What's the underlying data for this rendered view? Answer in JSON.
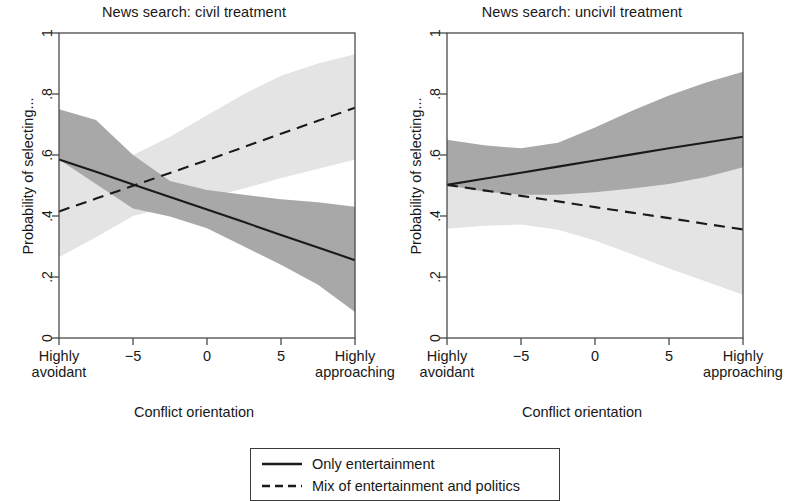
{
  "figure": {
    "ylabel": "Probability of selecting...",
    "xlabel": "Conflict orientation"
  },
  "panels": [
    {
      "title": "News search: civil treatment"
    },
    {
      "title": "News search: uncivil treatment"
    }
  ],
  "axis": {
    "y_ticks": [
      "0",
      ".2",
      ".4",
      ".6",
      ".8",
      "1"
    ],
    "x_ticks": [
      "Highly\navoidant",
      "−5",
      "0",
      "5",
      "Highly\napproaching"
    ],
    "x_tick_line1": [
      "Highly",
      "−5",
      "0",
      "5",
      "Highly"
    ],
    "x_tick_line2": [
      "avoidant",
      "",
      "",
      "",
      "approaching"
    ]
  },
  "legend": {
    "items": [
      {
        "label": "Only entertainment",
        "style": "solid"
      },
      {
        "label": "Mix of entertainment and politics",
        "style": "dashed"
      }
    ]
  },
  "colors": {
    "line": "#1a1a1a",
    "frame": "#4a4a4a",
    "band_dark": "#a8a8a8",
    "band_light": "#e4e4e4",
    "background": "#ffffff"
  },
  "chart_data": {
    "type": "line",
    "xlabel": "Conflict orientation",
    "ylabel": "Probability of selecting...",
    "xlim": [
      -10,
      10
    ],
    "ylim": [
      0,
      1
    ],
    "x_tick_values": [
      -10,
      -5,
      0,
      5,
      10
    ],
    "x_tick_labels": [
      "Highly avoidant",
      "-5",
      "0",
      "5",
      "Highly approaching"
    ],
    "y_ticks": [
      0,
      0.2,
      0.4,
      0.6,
      0.8,
      1
    ],
    "grid": false,
    "legend_position": "bottom-center",
    "panels": [
      {
        "title": "News search: civil treatment",
        "x": [
          -10,
          -7.5,
          -5,
          -2.5,
          0,
          2.5,
          5,
          7.5,
          10
        ],
        "series": [
          {
            "name": "Only entertainment",
            "style": "solid",
            "band_color": "#a8a8a8",
            "values": [
              0.585,
              0.545,
              0.503,
              0.462,
              0.421,
              0.38,
              0.338,
              0.297,
              0.255
            ],
            "ci_lower": [
              0.585,
              0.505,
              0.425,
              0.398,
              0.36,
              0.3,
              0.24,
              0.175,
              0.085
            ],
            "ci_upper": [
              0.75,
              0.715,
              0.6,
              0.515,
              0.485,
              0.47,
              0.455,
              0.445,
              0.43
            ]
          },
          {
            "name": "Mix of entertainment and politics",
            "style": "dashed",
            "band_color": "#e4e4e4",
            "values": [
              0.415,
              0.457,
              0.499,
              0.541,
              0.583,
              0.626,
              0.67,
              0.712,
              0.755
            ],
            "ci_lower": [
              0.265,
              0.33,
              0.4,
              0.43,
              0.46,
              0.49,
              0.525,
              0.555,
              0.585
            ],
            "ci_upper": [
              0.58,
              0.605,
              0.6,
              0.66,
              0.73,
              0.8,
              0.86,
              0.9,
              0.93
            ]
          }
        ]
      },
      {
        "title": "News search: uncivil treatment",
        "x": [
          -10,
          -7.5,
          -5,
          -2.5,
          0,
          2.5,
          5,
          7.5,
          10
        ],
        "series": [
          {
            "name": "Only entertainment",
            "style": "solid",
            "band_color": "#a8a8a8",
            "values": [
              0.502,
              0.522,
              0.542,
              0.562,
              0.582,
              0.602,
              0.622,
              0.641,
              0.66
            ],
            "ci_lower": [
              0.502,
              0.48,
              0.47,
              0.47,
              0.478,
              0.49,
              0.505,
              0.528,
              0.56
            ],
            "ci_upper": [
              0.65,
              0.632,
              0.622,
              0.64,
              0.69,
              0.745,
              0.795,
              0.838,
              0.873
            ]
          },
          {
            "name": "Mix of entertainment and politics",
            "style": "dashed",
            "band_color": "#e4e4e4",
            "values": [
              0.502,
              0.484,
              0.466,
              0.448,
              0.429,
              0.411,
              0.393,
              0.374,
              0.356
            ],
            "ci_lower": [
              0.358,
              0.368,
              0.372,
              0.355,
              0.32,
              0.275,
              0.228,
              0.185,
              0.142
            ],
            "ci_upper": [
              0.65,
              0.61,
              0.578,
              0.57,
              0.57,
              0.57,
              0.57,
              0.572,
              0.575
            ]
          }
        ]
      }
    ]
  }
}
